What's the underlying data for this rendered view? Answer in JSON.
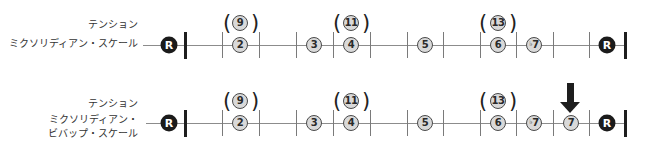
{
  "symbols": {
    "open_paren": "(",
    "close_paren": ")",
    "flat": "♭"
  },
  "rows": [
    {
      "tension_label": "テンション",
      "scale_label": [
        "ミクソリディアン・スケール"
      ],
      "root_start": "R",
      "tensions": [
        "9",
        "11",
        "13"
      ],
      "notes": [
        {
          "label": "2"
        },
        {
          "label": "3"
        },
        {
          "label": "4"
        },
        {
          "label": "5"
        },
        {
          "label": "6"
        },
        {
          "accidental": "♭",
          "label": "7"
        },
        {
          "label": "R"
        }
      ]
    },
    {
      "tension_label": "テンション",
      "scale_label": [
        "ミクソリディアン・",
        "ビバップ・スケール"
      ],
      "root_start": "R",
      "tensions": [
        "9",
        "11",
        "13"
      ],
      "notes": [
        {
          "label": "2"
        },
        {
          "label": "3"
        },
        {
          "label": "4"
        },
        {
          "label": "5"
        },
        {
          "label": "6"
        },
        {
          "accidental": "♭",
          "label": "7"
        },
        {
          "label": "7"
        },
        {
          "label": "R"
        }
      ],
      "highlighted_note": "7"
    }
  ],
  "colors": {
    "note_fill": "#d9d9d9",
    "note_border": "#4a4a4a",
    "root_fill": "#1b1b1b",
    "line": "#8c8c8c",
    "bar": "#1e1e1e"
  }
}
